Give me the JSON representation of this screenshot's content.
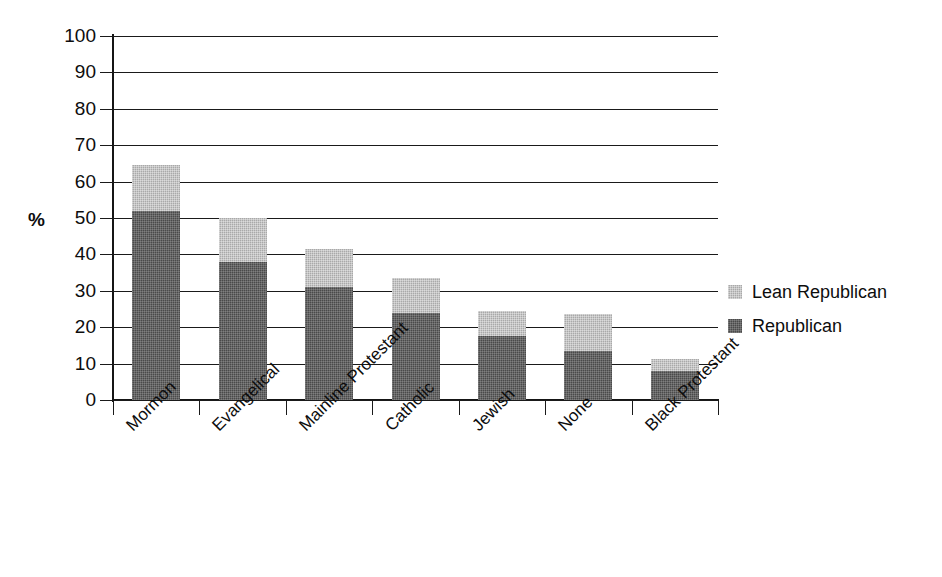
{
  "chart_data": {
    "type": "bar",
    "subtype": "stacked-vertical",
    "title": "",
    "subtitle": "",
    "xlabel": "",
    "ylabel": "%",
    "ylim": [
      0,
      100
    ],
    "yticks": [
      0,
      10,
      20,
      30,
      40,
      50,
      60,
      70,
      80,
      90,
      100
    ],
    "ytick_labels": [
      "0",
      "10",
      "20",
      "30",
      "40",
      "50",
      "60",
      "70",
      "80",
      "90",
      "100"
    ],
    "grid": true,
    "grid_axis": "y",
    "legend_position": "right",
    "categories": [
      "Mormon",
      "Evangelical",
      "Mainline Protestant",
      "Catholic",
      "Jewish",
      "None",
      "Black Protestant"
    ],
    "series": [
      {
        "name": "Republican",
        "color": "#4a4a4a",
        "values": [
          52,
          38,
          31,
          24,
          17.5,
          13.5,
          8
        ]
      },
      {
        "name": "Lean Republican",
        "color": "#a9a9a9",
        "values": [
          12.5,
          12,
          10.5,
          9.5,
          7,
          10,
          3.3
        ]
      }
    ],
    "totals": [
      64.5,
      50,
      41.5,
      33.5,
      24.5,
      23.5,
      11.3
    ],
    "stack_order_bottom_to_top": [
      "Republican",
      "Lean Republican"
    ]
  },
  "legend": {
    "items": [
      {
        "label": "Lean Republican",
        "swatch": "lean"
      },
      {
        "label": "Republican",
        "swatch": "rep"
      }
    ]
  },
  "axes": {
    "y_title": "%"
  }
}
